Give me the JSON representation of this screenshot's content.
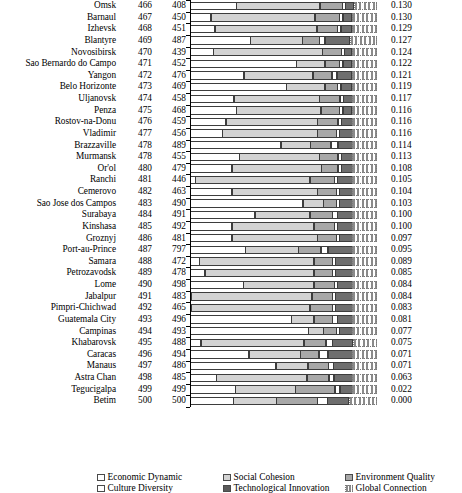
{
  "chart_data": {
    "type": "bar",
    "subtype": "horizontal-stacked",
    "title": "",
    "xlabel": "",
    "ylabel": "",
    "grid": false,
    "legend_position": "bottom",
    "xlim": [
      0,
      1
    ],
    "series": [
      {
        "name": "Economic Dynamic",
        "key": "economic",
        "color": "#ffffff"
      },
      {
        "name": "Social Cohesion",
        "key": "social",
        "color": "#d3d3d3"
      },
      {
        "name": "Environment Quality",
        "key": "environment",
        "color": "#a8a8a8"
      },
      {
        "name": "Culture Diversity",
        "key": "culture",
        "color": "#ffffff"
      },
      {
        "name": "Technological Innovation",
        "key": "techno",
        "color": "#5a5a5a"
      },
      {
        "name": "Global Connection",
        "key": "global",
        "color": "#8a8a8a"
      }
    ],
    "categories": [
      "Omsk",
      "Barnaul",
      "Izhevsk",
      "Blantyre",
      "Novosibirsk",
      "Sao Bernardo do Campo",
      "Yangon",
      "Belo Horizonte",
      "Uljanovsk",
      "Penza",
      "Rostov-na-Donu",
      "Vladimir",
      "Brazzaville",
      "Murmansk",
      "Or'ol",
      "Ranchi",
      "Cemerovo",
      "Sao Jose dos Campos",
      "Surabaya",
      "Kinshasa",
      "Groznyj",
      "Port-au-Prince",
      "Samara",
      "Petrozavodsk",
      "Lome",
      "Jabalpur",
      "Pimpri-Chichwad",
      "Guatemala City",
      "Campinas",
      "Khabarovsk",
      "Caracas",
      "Manaus",
      "Astra Chan",
      "Tegucigalpa",
      "Betim"
    ],
    "rows": [
      {
        "label": "Omsk",
        "rank_a": "466",
        "rank_b": "408",
        "value": "0.130",
        "segments": [
          26,
          47,
          13,
          2,
          5,
          13
        ]
      },
      {
        "label": "Barnaul",
        "rank_a": "467",
        "rank_b": "450",
        "value": "0.130",
        "segments": [
          11,
          54,
          13,
          2,
          5,
          13
        ]
      },
      {
        "label": "Izhevsk",
        "rank_a": "468",
        "rank_b": "451",
        "value": "0.129",
        "segments": [
          13,
          53,
          11,
          2,
          6,
          13
        ]
      },
      {
        "label": "Blantyre",
        "rank_a": "469",
        "rank_b": "487",
        "value": "0.127",
        "segments": [
          31,
          27,
          9,
          3,
          13,
          14
        ]
      },
      {
        "label": "Novosibirsk",
        "rank_a": "470",
        "rank_b": "439",
        "value": "0.124",
        "segments": [
          12,
          56,
          10,
          2,
          4,
          13
        ]
      },
      {
        "label": "Sao Bernardo do Campo",
        "rank_a": "471",
        "rank_b": "452",
        "value": "0.122",
        "segments": [
          55,
          15,
          8,
          2,
          5,
          13
        ]
      },
      {
        "label": "Yangon",
        "rank_a": "472",
        "rank_b": "476",
        "value": "0.121",
        "segments": [
          28,
          36,
          10,
          3,
          8,
          13
        ]
      },
      {
        "label": "Belo Horizonte",
        "rank_a": "473",
        "rank_b": "469",
        "value": "0.119",
        "segments": [
          50,
          20,
          7,
          2,
          6,
          13
        ]
      },
      {
        "label": "Uljanovsk",
        "rank_a": "474",
        "rank_b": "458",
        "value": "0.117",
        "segments": [
          23,
          45,
          11,
          2,
          5,
          13
        ]
      },
      {
        "label": "Penza",
        "rank_a": "475",
        "rank_b": "468",
        "value": "0.116",
        "segments": [
          24,
          44,
          10,
          2,
          5,
          13
        ]
      },
      {
        "label": "Rostov-na-Donu",
        "rank_a": "476",
        "rank_b": "459",
        "value": "0.116",
        "segments": [
          19,
          48,
          11,
          2,
          6,
          13
        ]
      },
      {
        "label": "Vladimir",
        "rank_a": "477",
        "rank_b": "456",
        "value": "0.116",
        "segments": [
          17,
          50,
          10,
          2,
          7,
          13
        ]
      },
      {
        "label": "Brazzaville",
        "rank_a": "478",
        "rank_b": "489",
        "value": "0.114",
        "segments": [
          48,
          16,
          11,
          4,
          8,
          13
        ]
      },
      {
        "label": "Murmansk",
        "rank_a": "478",
        "rank_b": "455",
        "value": "0.113",
        "segments": [
          26,
          42,
          10,
          2,
          6,
          13
        ]
      },
      {
        "label": "Or'ol",
        "rank_a": "480",
        "rank_b": "479",
        "value": "0.108",
        "segments": [
          22,
          47,
          9,
          2,
          6,
          13
        ]
      },
      {
        "label": "Ranchi",
        "rank_a": "481",
        "rank_b": "446",
        "value": "0.105",
        "segments": [
          3,
          60,
          13,
          2,
          8,
          13
        ]
      },
      {
        "label": "Cemerovo",
        "rank_a": "482",
        "rank_b": "463",
        "value": "0.104",
        "segments": [
          22,
          45,
          10,
          2,
          7,
          13
        ]
      },
      {
        "label": "Sao Jose dos Campos",
        "rank_a": "483",
        "rank_b": "490",
        "value": "0.103",
        "segments": [
          59,
          11,
          7,
          2,
          7,
          13
        ]
      },
      {
        "label": "Surabaya",
        "rank_a": "484",
        "rank_b": "491",
        "value": "0.100",
        "segments": [
          34,
          29,
          12,
          3,
          8,
          13
        ]
      },
      {
        "label": "Kinshasa",
        "rank_a": "485",
        "rank_b": "492",
        "value": "0.100",
        "segments": [
          22,
          43,
          11,
          2,
          8,
          13
        ]
      },
      {
        "label": "Groznyj",
        "rank_a": "486",
        "rank_b": "481",
        "value": "0.097",
        "segments": [
          22,
          45,
          10,
          2,
          7,
          13
        ]
      },
      {
        "label": "Port-au-Prince",
        "rank_a": "487",
        "rank_b": "797",
        "value": "0.095",
        "segments": [
          29,
          28,
          12,
          4,
          13,
          13
        ]
      },
      {
        "label": "Samara",
        "rank_a": "488",
        "rank_b": "472",
        "value": "0.089",
        "segments": [
          5,
          60,
          10,
          2,
          9,
          13
        ]
      },
      {
        "label": "Petrozavodsk",
        "rank_a": "489",
        "rank_b": "478",
        "value": "0.085",
        "segments": [
          8,
          57,
          10,
          2,
          9,
          13
        ]
      },
      {
        "label": "Lome",
        "rank_a": "490",
        "rank_b": "498",
        "value": "0.084",
        "segments": [
          28,
          37,
          11,
          2,
          8,
          13
        ]
      },
      {
        "label": "Jabalpur",
        "rank_a": "491",
        "rank_b": "483",
        "value": "0.084",
        "segments": [
          1,
          63,
          11,
          2,
          9,
          13
        ]
      },
      {
        "label": "Pimpri-Chichwad",
        "rank_a": "492",
        "rank_b": "465",
        "value": "0.083",
        "segments": [
          1,
          62,
          12,
          2,
          9,
          13
        ]
      },
      {
        "label": "Guatemala City",
        "rank_a": "493",
        "rank_b": "496",
        "value": "0.081",
        "segments": [
          53,
          12,
          10,
          3,
          8,
          13
        ]
      },
      {
        "label": "Campinas",
        "rank_a": "494",
        "rank_b": "493",
        "value": "0.077",
        "segments": [
          62,
          8,
          7,
          2,
          7,
          13
        ]
      },
      {
        "label": "Khabarovsk",
        "rank_a": "495",
        "rank_b": "488",
        "value": "0.075",
        "segments": [
          6,
          55,
          12,
          4,
          11,
          13
        ]
      },
      {
        "label": "Caracas",
        "rank_a": "496",
        "rank_b": "494",
        "value": "0.071",
        "segments": [
          31,
          27,
          10,
          5,
          13,
          13
        ]
      },
      {
        "label": "Manaus",
        "rank_a": "497",
        "rank_b": "486",
        "value": "0.071",
        "segments": [
          45,
          17,
          11,
          3,
          10,
          13
        ]
      },
      {
        "label": "Astra Chan",
        "rank_a": "498",
        "rank_b": "485",
        "value": "0.063",
        "segments": [
          14,
          48,
          12,
          3,
          10,
          13
        ]
      },
      {
        "label": "Tegucigalpa",
        "rank_a": "499",
        "rank_b": "499",
        "value": "0.022",
        "segments": [
          24,
          32,
          21,
          3,
          7,
          13
        ]
      },
      {
        "label": "Betim",
        "rank_a": "500",
        "rank_b": "500",
        "value": "0.000",
        "segments": [
          20,
          20,
          19,
          5,
          10,
          13
        ]
      }
    ]
  },
  "legend": {
    "rows": [
      [
        {
          "label": "Economic Dynamic",
          "key": "economic"
        },
        {
          "label": "Social Cohesion",
          "key": "social"
        },
        {
          "label": "Environment Quality",
          "key": "environment"
        }
      ],
      [
        {
          "label": "Culture Diversity",
          "key": "culture"
        },
        {
          "label": "Technological Innovation",
          "key": "techno"
        },
        {
          "label": "Global Connection",
          "key": "global"
        }
      ]
    ]
  }
}
